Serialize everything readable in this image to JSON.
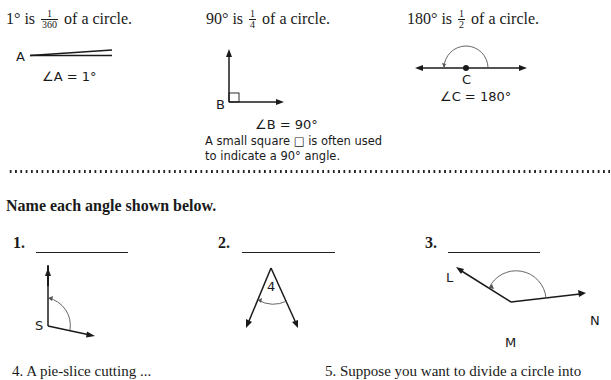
{
  "examples": [
    {
      "degree": "1°",
      "is": "is",
      "frac_num": "1",
      "frac_den": "360",
      "suffix": "of a circle.",
      "vertex_label": "A",
      "equation": "∠A = 1°"
    },
    {
      "degree": "90°",
      "is": "is",
      "frac_num": "1",
      "frac_den": "4",
      "suffix": "of a circle.",
      "vertex_label": "B",
      "equation": "∠B = 90°",
      "note_line1": "A small square □ is often used",
      "note_line2": "to indicate a 90° angle."
    },
    {
      "degree": "180°",
      "is": "is",
      "frac_num": "1",
      "frac_den": "2",
      "suffix": "of a circle.",
      "vertex_label": "C",
      "equation": "∠C = 180°"
    }
  ],
  "instructions": "Name each angle shown below.",
  "questions": [
    {
      "number": "1.",
      "answer": "",
      "vertex_label": "S"
    },
    {
      "number": "2.",
      "answer": "",
      "angle_label": "4"
    },
    {
      "number": "3.",
      "answer": "",
      "labels": [
        "L",
        "M",
        "N"
      ]
    }
  ],
  "cutoff": {
    "q4": "4.  A pie-slice cutting ... ",
    "q5": "5.  Suppose you want to divide a circle into"
  }
}
